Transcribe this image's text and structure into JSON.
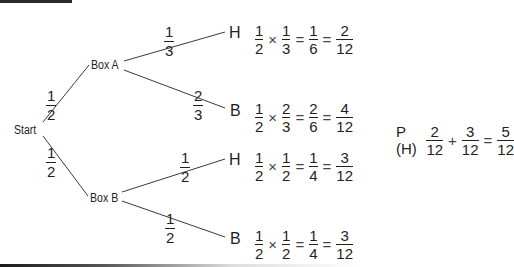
{
  "diagram": {
    "type": "probability-tree",
    "root": {
      "label": "Start"
    },
    "branches": [
      {
        "node": "Box A",
        "probability": {
          "num": "1",
          "den": "2"
        },
        "children": [
          {
            "outcome": "H",
            "probability": {
              "num": "1",
              "den": "3"
            },
            "calc": [
              {
                "num": "1",
                "den": "2"
              },
              "×",
              {
                "num": "1",
                "den": "3"
              },
              "=",
              {
                "num": "1",
                "den": "6"
              },
              "=",
              {
                "num": "2",
                "den": "12"
              }
            ]
          },
          {
            "outcome": "B",
            "probability": {
              "num": "2",
              "den": "3"
            },
            "calc": [
              {
                "num": "1",
                "den": "2"
              },
              "×",
              {
                "num": "2",
                "den": "3"
              },
              "=",
              {
                "num": "2",
                "den": "6"
              },
              "=",
              {
                "num": "4",
                "den": "12"
              }
            ]
          }
        ]
      },
      {
        "node": "Box B",
        "probability": {
          "num": "1",
          "den": "2"
        },
        "children": [
          {
            "outcome": "H",
            "probability": {
              "num": "1",
              "den": "2"
            },
            "calc": [
              {
                "num": "1",
                "den": "2"
              },
              "×",
              {
                "num": "1",
                "den": "2"
              },
              "=",
              {
                "num": "1",
                "den": "4"
              },
              "=",
              {
                "num": "3",
                "den": "12"
              }
            ]
          },
          {
            "outcome": "B",
            "probability": {
              "num": "1",
              "den": "2"
            },
            "calc": [
              {
                "num": "1",
                "den": "2"
              },
              "×",
              {
                "num": "1",
                "den": "2"
              },
              "=",
              {
                "num": "1",
                "den": "4"
              },
              "=",
              {
                "num": "3",
                "den": "12"
              }
            ]
          }
        ]
      }
    ],
    "result": {
      "label": "P (H)",
      "terms": [
        {
          "num": "2",
          "den": "12"
        },
        "+",
        {
          "num": "3",
          "den": "12"
        },
        "=",
        {
          "num": "5",
          "den": "12"
        }
      ]
    }
  },
  "colors": {
    "ink": "#231f20",
    "line": "#3a3a3a",
    "background": "#ffffff"
  }
}
